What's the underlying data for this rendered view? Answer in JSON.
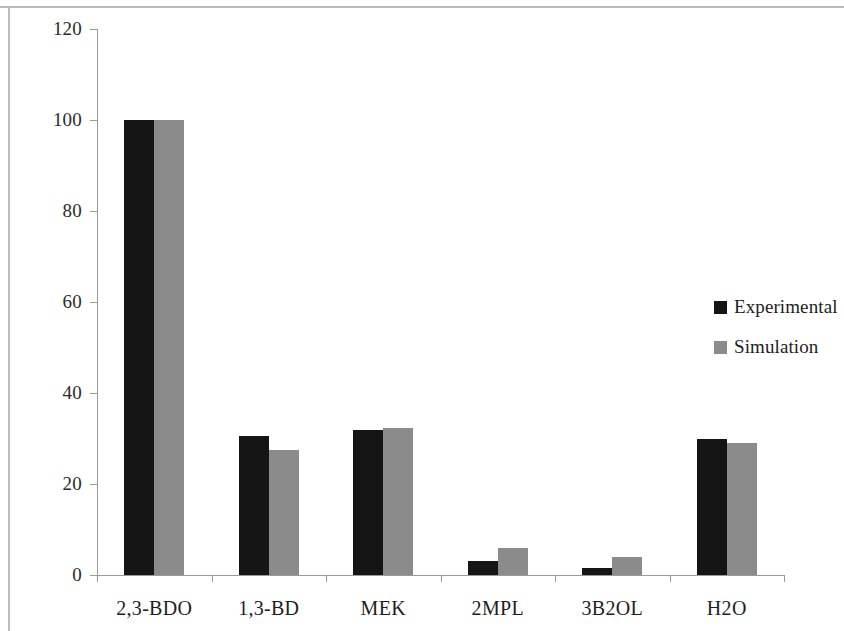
{
  "chart_data": {
    "type": "bar",
    "title": "",
    "xlabel": "",
    "ylabel": "2,3-BDO conversion & Selectivity [%]",
    "ylim": [
      0,
      120
    ],
    "yticks": [
      0,
      20,
      40,
      60,
      80,
      100,
      120
    ],
    "grid": false,
    "legend_position": "right",
    "categories": [
      "2,3-BDO",
      "1,3-BD",
      "MEK",
      "2MPL",
      "3B2OL",
      "H2O"
    ],
    "series": [
      {
        "name": "Experimental",
        "color": "#151515",
        "values": [
          100,
          30.5,
          31.8,
          3,
          1.5,
          30
        ]
      },
      {
        "name": "Simulation",
        "color": "#8b8b8b",
        "values": [
          100,
          27.5,
          32.3,
          6,
          4,
          29
        ]
      }
    ]
  },
  "axis": {
    "y_label": "2,3-BDO conversion & Selectivity [%]",
    "tick_labels": [
      "120",
      "100",
      "80",
      "60",
      "40",
      "20",
      "0"
    ]
  },
  "legend": {
    "entries": [
      {
        "label": "Experimental",
        "swatch": "black-square-swatch"
      },
      {
        "label": "Simulation",
        "swatch": "gray-square-swatch"
      }
    ]
  }
}
